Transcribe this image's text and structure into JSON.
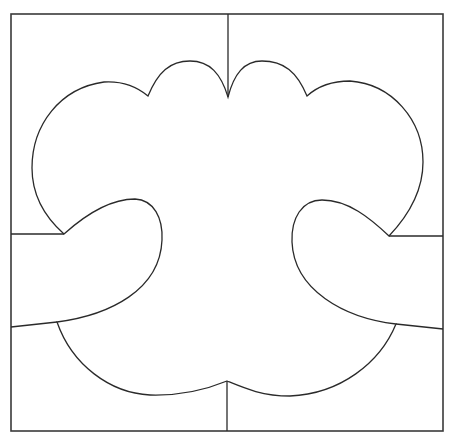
{
  "diagram": {
    "type": "line-drawing",
    "background_color": "#ffffff",
    "line_color": "#2a2a2a",
    "frame": {
      "x": 11,
      "y": 14,
      "width": 432,
      "height": 417
    },
    "regions": [
      {
        "name": "top-left"
      },
      {
        "name": "top-right"
      },
      {
        "name": "left-middle"
      },
      {
        "name": "right-middle"
      },
      {
        "name": "bottom-left"
      },
      {
        "name": "bottom-right"
      },
      {
        "name": "center-shape"
      }
    ]
  }
}
